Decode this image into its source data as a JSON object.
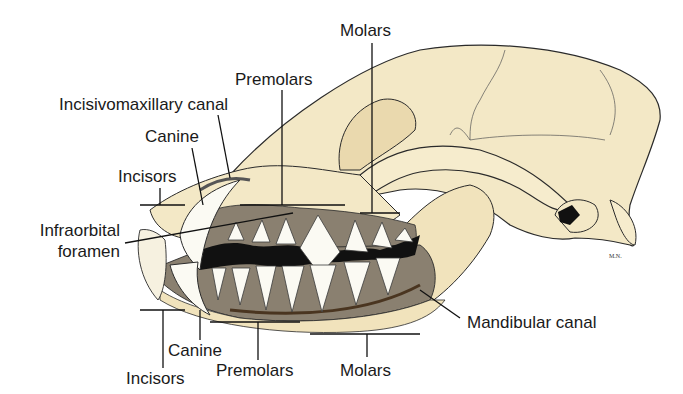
{
  "diagram": {
    "colors": {
      "bone": "#f3e8c6",
      "bone_shade": "#e6d2a4",
      "alveolar_bone": "#8a8070",
      "tooth": "#fbfaf3",
      "outline": "#2a2a2a",
      "background": "#ffffff"
    },
    "labels": {
      "molars_top": "Molars",
      "premolars_top": "Premolars",
      "incisivomaxillary_canal": "Incisivomaxillary canal",
      "canine_top": "Canine",
      "incisors_top": "Incisors",
      "infraorbital_foramen_line1": "Infraorbital",
      "infraorbital_foramen_line2": "foramen",
      "mandibular_canal": "Mandibular canal",
      "canine_bottom": "Canine",
      "incisors_bottom": "Incisors",
      "premolars_bottom": "Premolars",
      "molars_bottom": "Molars"
    },
    "signature": "M.N."
  }
}
